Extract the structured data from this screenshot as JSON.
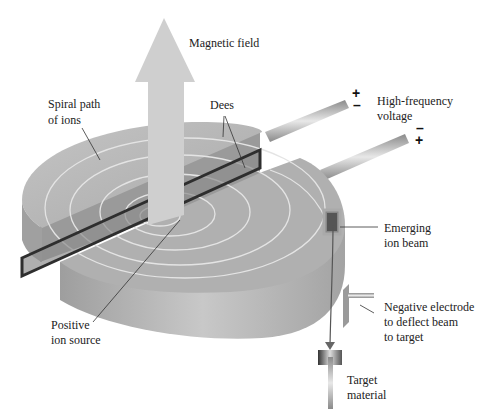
{
  "diagram": {
    "labels": {
      "magnetic_field": "Magnetic field",
      "spiral_path_line1": "Spiral path",
      "spiral_path_line2": "of ions",
      "dees": "Dees",
      "hf_voltage_line1": "High-frequency",
      "hf_voltage_line2": "voltage",
      "emerging_line1": "Emerging",
      "emerging_line2": "ion beam",
      "electrode_line1": "Negative electrode",
      "electrode_line2": "to deflect beam",
      "electrode_line3": "to target",
      "source_line1": "Positive",
      "source_line2": "ion source",
      "target_line1": "Target",
      "target_line2": "material"
    },
    "signs": {
      "upper_top": "+",
      "upper_bottom": "–",
      "lower_top": "–",
      "lower_bottom": "+"
    },
    "colors": {
      "disc_top": "#b9b9b9",
      "disc_side": "#a8a8a8",
      "arrow": "#cfcfcf",
      "gap_frame": "#333333",
      "spiral": "#e6e6e6",
      "beam": "#555555"
    }
  }
}
